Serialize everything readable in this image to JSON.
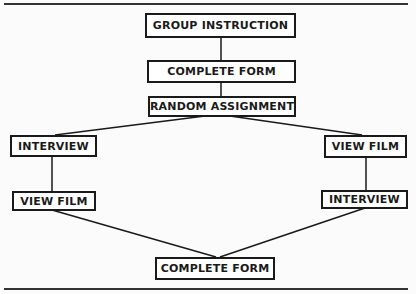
{
  "diagram": {
    "type": "flowchart",
    "nodes": [
      {
        "id": "group_instruction",
        "label": "GROUP INSTRUCTION"
      },
      {
        "id": "complete_form_1",
        "label": "COMPLETE FORM"
      },
      {
        "id": "random_assignment",
        "label": "RANDOM ASSIGNMENT"
      },
      {
        "id": "left_interview",
        "label": "INTERVIEW"
      },
      {
        "id": "left_view_film",
        "label": "VIEW FILM"
      },
      {
        "id": "right_view_film",
        "label": "VIEW FILM"
      },
      {
        "id": "right_interview",
        "label": "INTERVIEW"
      },
      {
        "id": "complete_form_2",
        "label": "COMPLETE FORM"
      }
    ],
    "edges": [
      [
        "group_instruction",
        "complete_form_1"
      ],
      [
        "complete_form_1",
        "random_assignment"
      ],
      [
        "random_assignment",
        "left_interview"
      ],
      [
        "random_assignment",
        "right_view_film"
      ],
      [
        "left_interview",
        "left_view_film"
      ],
      [
        "right_view_film",
        "right_interview"
      ],
      [
        "left_view_film",
        "complete_form_2"
      ],
      [
        "right_interview",
        "complete_form_2"
      ]
    ],
    "colors": {
      "line": "#1a1a1a",
      "background": "#fbfbfb",
      "box_fill": "#ffffff"
    }
  }
}
